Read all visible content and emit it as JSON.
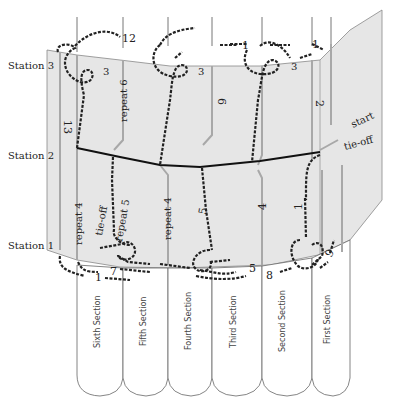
{
  "diagram": {
    "type": "bookbinding-sewing-diagram",
    "stations": [
      {
        "label": "Station 3"
      },
      {
        "label": "Station 2"
      },
      {
        "label": "Station 1"
      }
    ],
    "sections": [
      {
        "label": "Sixth Section"
      },
      {
        "label": "Fifth Section"
      },
      {
        "label": "Fourth Section"
      },
      {
        "label": "Third Section"
      },
      {
        "label": "Second Section"
      },
      {
        "label": "First Section"
      }
    ],
    "annotations": {
      "start": "start",
      "tie_off_top": "tie-off",
      "tie_off_bottom": "tie-off",
      "repeat_6": "repeat 6",
      "repeat_5": "repeat 5",
      "repeat_4_left": "repeat 4",
      "repeat_4_mid": "repeat 4"
    },
    "step_numbers": {
      "s1_top_left": "1",
      "s1_top_right": "1",
      "s1_mid": "1",
      "s1_bottom": "1",
      "s2": "2",
      "s3_a": "3",
      "s3_b": "3",
      "s3_c": "3",
      "s4": "4",
      "s5_a": "5",
      "s5_b": "5",
      "s6": "6",
      "s7": "7",
      "s8": "8",
      "s9": "9",
      "s12": "12",
      "s13": "13"
    },
    "colors": {
      "panel_fill": "#e6e6e6",
      "thread": "#222222",
      "guide_line": "#a8a8a8",
      "kettle_line": "#111111"
    }
  }
}
